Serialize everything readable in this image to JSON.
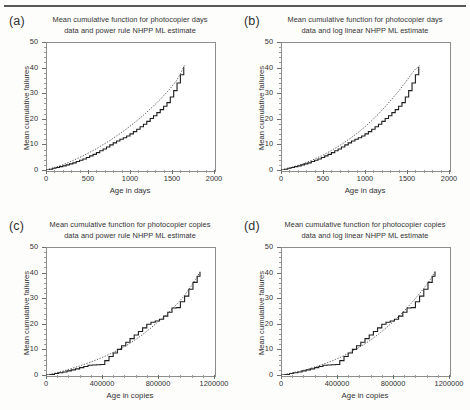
{
  "figure": {
    "background": "#fdfdfc",
    "axis_color": "#8d8d8d",
    "data_color": "#1d1d1d",
    "fit_color": "#4a4a4a",
    "panel_count": 4
  },
  "panels": [
    {
      "letter": "(a)",
      "title_line1": "Mean cumulative function for photocopier days",
      "title_line2": "data  and power rule NHPP ML estimate",
      "xlabel": "Age in days",
      "ylabel": "Mean cumulative failures",
      "xticks": [
        "0",
        "500",
        "1000",
        "1500",
        "2000"
      ],
      "yticks": [
        "0",
        "10",
        "20",
        "30",
        "40",
        "50"
      ]
    },
    {
      "letter": "(b)",
      "title_line1": "Mean cumulative function for photocopier days",
      "title_line2": "data  and log linear NHPP ML estimate",
      "xlabel": "Age in days",
      "ylabel": "Mean cumulative failures",
      "xticks": [
        "0",
        "500",
        "1000",
        "1500",
        "2000"
      ],
      "yticks": [
        "0",
        "10",
        "20",
        "30",
        "40",
        "50"
      ]
    },
    {
      "letter": "(c)",
      "title_line1": "Mean cumulative function for photocopier copies",
      "title_line2": "data  and power rule NHPP ML estimate",
      "xlabel": "Age in copies",
      "ylabel": "Mean cumulative failures",
      "xticks": [
        "0",
        "400000",
        "800000",
        "1200000"
      ],
      "yticks": [
        "0",
        "10",
        "20",
        "30",
        "40",
        "50"
      ]
    },
    {
      "letter": "(d)",
      "title_line1": "Mean cumulative function for photocopier copies",
      "title_line2": "data  and log linear NHPP ML estimate",
      "xlabel": "Age in copies",
      "ylabel": "Mean cumulative failures",
      "xticks": [
        "0",
        "400000",
        "800000",
        "1200000"
      ],
      "yticks": [
        "0",
        "10",
        "20",
        "30",
        "40",
        "50"
      ]
    }
  ],
  "chart_data": [
    {
      "type": "line",
      "panel": "(a)",
      "title": "Mean cumulative function for photocopier days data  and power rule NHPP ML estimate",
      "xlabel": "Age in days",
      "ylabel": "Mean cumulative failures",
      "xlim": [
        0,
        2000
      ],
      "ylim": [
        0,
        50
      ],
      "xticks": [
        0,
        500,
        1000,
        1500,
        2000
      ],
      "yticks": [
        0,
        10,
        20,
        30,
        40,
        50
      ],
      "grid": false,
      "legend": "none",
      "series": [
        {
          "name": "Mean cumulative function data (step)",
          "style": "step",
          "x": [
            0,
            40,
            80,
            120,
            160,
            200,
            240,
            280,
            320,
            360,
            400,
            440,
            480,
            520,
            560,
            600,
            640,
            680,
            720,
            760,
            800,
            840,
            880,
            920,
            960,
            1000,
            1040,
            1080,
            1120,
            1160,
            1200,
            1240,
            1280,
            1320,
            1360,
            1400,
            1440,
            1480,
            1520,
            1560,
            1600,
            1640
          ],
          "y": [
            0.0,
            0.3,
            0.7,
            1.0,
            1.3,
            1.6,
            2.0,
            2.4,
            2.8,
            3.3,
            3.8,
            4.3,
            4.9,
            5.5,
            6.1,
            6.8,
            7.5,
            8.2,
            9.0,
            9.8,
            10.6,
            11.3,
            12.0,
            12.6,
            13.3,
            14.1,
            15.0,
            15.9,
            16.9,
            17.9,
            19.0,
            20.1,
            21.2,
            22.4,
            23.6,
            24.9,
            26.3,
            28.5,
            31.0,
            34.0,
            37.2,
            40.2
          ]
        },
        {
          "name": "Power rule NHPP ML estimate (fit)",
          "style": "dotted",
          "x": [
            0,
            40,
            80,
            120,
            160,
            200,
            240,
            280,
            320,
            360,
            400,
            440,
            480,
            520,
            560,
            600,
            640,
            680,
            720,
            760,
            800,
            840,
            880,
            920,
            960,
            1000,
            1040,
            1080,
            1120,
            1160,
            1200,
            1240,
            1280,
            1320,
            1360,
            1400,
            1440,
            1480,
            1520,
            1560,
            1600,
            1650
          ],
          "y": [
            0.0,
            0.35,
            0.8,
            1.2,
            1.6,
            2.1,
            2.6,
            3.1,
            3.7,
            4.3,
            4.9,
            5.5,
            6.2,
            6.9,
            7.6,
            8.3,
            9.1,
            9.9,
            10.7,
            11.5,
            12.4,
            13.3,
            14.2,
            15.1,
            16.1,
            17.1,
            18.1,
            19.2,
            20.3,
            21.4,
            22.6,
            23.8,
            25.0,
            26.3,
            27.6,
            29.0,
            30.4,
            31.9,
            33.5,
            35.2,
            37.6,
            41.0
          ]
        }
      ]
    },
    {
      "type": "line",
      "panel": "(b)",
      "title": "Mean cumulative function for photocopier days data  and log linear NHPP ML estimate",
      "xlabel": "Age in days",
      "ylabel": "Mean cumulative failures",
      "xlim": [
        0,
        2000
      ],
      "ylim": [
        0,
        50
      ],
      "xticks": [
        0,
        500,
        1000,
        1500,
        2000
      ],
      "yticks": [
        0,
        10,
        20,
        30,
        40,
        50
      ],
      "grid": false,
      "legend": "none",
      "series": [
        {
          "name": "Mean cumulative function data (step)",
          "style": "step",
          "x": [
            0,
            40,
            80,
            120,
            160,
            200,
            240,
            280,
            320,
            360,
            400,
            440,
            480,
            520,
            560,
            600,
            640,
            680,
            720,
            760,
            800,
            840,
            880,
            920,
            960,
            1000,
            1040,
            1080,
            1120,
            1160,
            1200,
            1240,
            1280,
            1320,
            1360,
            1400,
            1440,
            1480,
            1520,
            1560,
            1600,
            1640
          ],
          "y": [
            0.0,
            0.3,
            0.7,
            1.0,
            1.3,
            1.6,
            2.0,
            2.4,
            2.8,
            3.3,
            3.8,
            4.3,
            4.9,
            5.5,
            6.1,
            6.8,
            7.5,
            8.2,
            9.0,
            9.8,
            10.6,
            11.3,
            12.0,
            12.6,
            13.3,
            14.1,
            15.0,
            15.9,
            16.9,
            17.9,
            19.0,
            20.1,
            21.2,
            22.4,
            23.6,
            24.9,
            26.3,
            28.5,
            31.0,
            34.0,
            37.2,
            40.2
          ]
        },
        {
          "name": "Log linear NHPP ML estimate (fit)",
          "style": "dotted",
          "x": [
            0,
            40,
            80,
            120,
            160,
            200,
            240,
            280,
            320,
            360,
            400,
            440,
            480,
            520,
            560,
            600,
            640,
            680,
            720,
            760,
            800,
            840,
            880,
            920,
            960,
            1000,
            1040,
            1080,
            1120,
            1160,
            1200,
            1240,
            1280,
            1320,
            1360,
            1400,
            1440,
            1480,
            1520,
            1560,
            1600,
            1650
          ],
          "y": [
            0.0,
            0.3,
            0.65,
            1.0,
            1.4,
            1.8,
            2.2,
            2.7,
            3.2,
            3.7,
            4.3,
            4.9,
            5.5,
            6.2,
            6.9,
            7.6,
            8.4,
            9.2,
            10.0,
            10.9,
            11.8,
            12.7,
            13.7,
            14.7,
            15.8,
            16.9,
            18.1,
            19.3,
            20.6,
            21.9,
            23.3,
            24.7,
            26.2,
            27.7,
            29.2,
            30.8,
            32.5,
            34.2,
            36.0,
            37.8,
            39.4,
            40.8
          ]
        }
      ]
    },
    {
      "type": "line",
      "panel": "(c)",
      "title": "Mean cumulative function for photocopier copies data  and power rule NHPP ML estimate",
      "xlabel": "Age in copies",
      "ylabel": "Mean cumulative failures",
      "xlim": [
        0,
        1200000
      ],
      "ylim": [
        0,
        50
      ],
      "xticks": [
        0,
        400000,
        800000,
        1200000
      ],
      "yticks": [
        0,
        10,
        20,
        30,
        40,
        50
      ],
      "grid": false,
      "legend": "none",
      "series": [
        {
          "name": "Mean cumulative function data (step)",
          "style": "step",
          "x": [
            0,
            30000,
            60000,
            90000,
            120000,
            150000,
            180000,
            210000,
            240000,
            270000,
            300000,
            330000,
            360000,
            390000,
            420000,
            450000,
            480000,
            510000,
            540000,
            570000,
            600000,
            630000,
            660000,
            690000,
            720000,
            750000,
            780000,
            810000,
            840000,
            870000,
            900000,
            930000,
            960000,
            990000,
            1020000,
            1050000,
            1080000,
            1100000
          ],
          "y": [
            0.0,
            0.2,
            0.6,
            0.9,
            1.2,
            1.6,
            2.0,
            2.4,
            2.9,
            3.3,
            3.8,
            3.9,
            4.0,
            4.1,
            5.6,
            7.2,
            8.6,
            10.0,
            11.4,
            12.8,
            14.2,
            15.6,
            17.0,
            18.4,
            19.8,
            20.6,
            21.1,
            21.8,
            23.0,
            24.5,
            26.2,
            26.3,
            28.6,
            30.8,
            33.5,
            36.2,
            38.6,
            40.3
          ]
        },
        {
          "name": "Power rule NHPP ML estimate (fit)",
          "style": "dotted",
          "x": [
            0,
            30000,
            60000,
            90000,
            120000,
            150000,
            180000,
            210000,
            240000,
            270000,
            300000,
            330000,
            360000,
            390000,
            420000,
            450000,
            480000,
            510000,
            540000,
            570000,
            600000,
            630000,
            660000,
            690000,
            720000,
            750000,
            780000,
            810000,
            840000,
            870000,
            900000,
            930000,
            960000,
            990000,
            1020000,
            1050000,
            1080000,
            1100000
          ],
          "y": [
            0.0,
            0.3,
            0.7,
            1.1,
            1.5,
            2.0,
            2.5,
            3.0,
            3.5,
            4.1,
            4.7,
            5.3,
            5.9,
            6.6,
            7.3,
            8.0,
            8.8,
            9.6,
            10.5,
            11.4,
            12.4,
            13.5,
            14.6,
            15.8,
            17.1,
            18.4,
            19.8,
            21.2,
            22.6,
            24.1,
            25.7,
            27.4,
            29.2,
            31.2,
            33.4,
            35.8,
            38.4,
            40.2
          ]
        }
      ]
    },
    {
      "type": "line",
      "panel": "(d)",
      "title": "Mean cumulative function for photocopier copies data  and log linear NHPP ML estimate",
      "xlabel": "Age in copies",
      "ylabel": "Mean cumulative failures",
      "xlim": [
        0,
        1200000
      ],
      "ylim": [
        0,
        50
      ],
      "xticks": [
        0,
        400000,
        800000,
        1200000
      ],
      "yticks": [
        0,
        10,
        20,
        30,
        40,
        50
      ],
      "grid": false,
      "legend": "none",
      "series": [
        {
          "name": "Mean cumulative function data (step)",
          "style": "step",
          "x": [
            0,
            30000,
            60000,
            90000,
            120000,
            150000,
            180000,
            210000,
            240000,
            270000,
            300000,
            330000,
            360000,
            390000,
            420000,
            450000,
            480000,
            510000,
            540000,
            570000,
            600000,
            630000,
            660000,
            690000,
            720000,
            750000,
            780000,
            810000,
            840000,
            870000,
            900000,
            930000,
            960000,
            990000,
            1020000,
            1050000,
            1080000,
            1100000
          ],
          "y": [
            0.0,
            0.2,
            0.6,
            0.9,
            1.2,
            1.6,
            2.0,
            2.4,
            2.9,
            3.3,
            3.8,
            3.9,
            4.0,
            4.1,
            5.6,
            7.2,
            8.6,
            10.0,
            11.4,
            12.8,
            14.2,
            15.6,
            17.0,
            18.4,
            19.8,
            20.6,
            21.1,
            21.8,
            23.0,
            24.5,
            26.2,
            26.3,
            28.6,
            30.8,
            33.5,
            36.2,
            38.6,
            40.3
          ]
        },
        {
          "name": "Log linear NHPP ML estimate (fit)",
          "style": "dotted",
          "x": [
            0,
            30000,
            60000,
            90000,
            120000,
            150000,
            180000,
            210000,
            240000,
            270000,
            300000,
            330000,
            360000,
            390000,
            420000,
            450000,
            480000,
            510000,
            540000,
            570000,
            600000,
            630000,
            660000,
            690000,
            720000,
            750000,
            780000,
            810000,
            840000,
            870000,
            900000,
            930000,
            960000,
            990000,
            1020000,
            1050000,
            1080000,
            1100000
          ],
          "y": [
            0.0,
            0.25,
            0.6,
            0.95,
            1.3,
            1.7,
            2.1,
            2.6,
            3.1,
            3.6,
            4.2,
            4.8,
            5.4,
            6.1,
            6.8,
            7.6,
            8.4,
            9.3,
            10.2,
            11.2,
            12.2,
            13.3,
            14.5,
            15.7,
            17.0,
            18.4,
            19.8,
            21.3,
            22.9,
            24.5,
            26.2,
            28.0,
            29.9,
            31.8,
            33.8,
            36.0,
            38.4,
            40.5
          ]
        }
      ]
    }
  ]
}
